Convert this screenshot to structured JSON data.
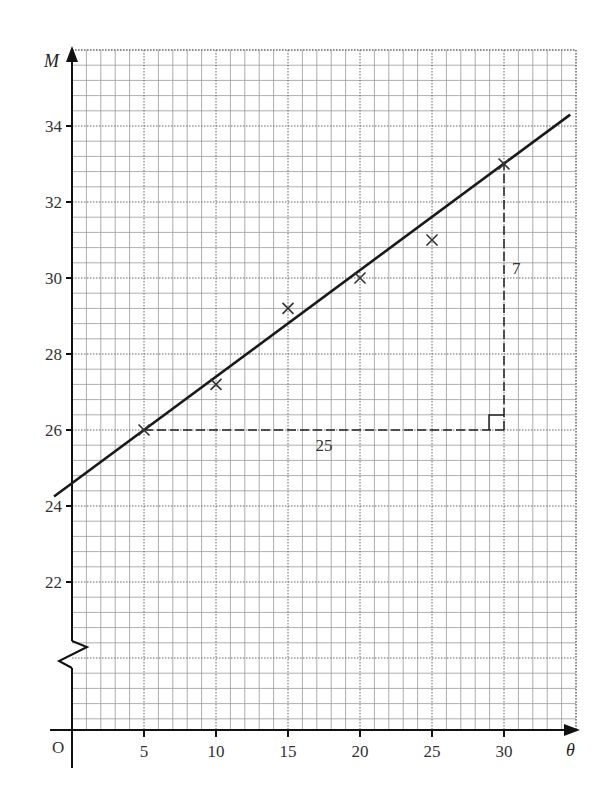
{
  "chart_data": {
    "type": "scatter",
    "title": "",
    "xlabel": "θ",
    "ylabel": "M",
    "origin_label": "O",
    "xlim": [
      0,
      35
    ],
    "ylim": [
      20,
      36
    ],
    "y_axis_broken": true,
    "grid": true,
    "x_ticks": [
      5,
      10,
      15,
      20,
      25,
      30
    ],
    "x_tick_labels": [
      "5",
      "10",
      "15",
      "20",
      "25",
      "30"
    ],
    "y_ticks": [
      22,
      24,
      26,
      28,
      30,
      32,
      34
    ],
    "y_tick_labels": [
      "22",
      "24",
      "26",
      "28",
      "30",
      "32",
      "34"
    ],
    "series": [
      {
        "name": "data points",
        "marker": "x",
        "x": [
          5,
          10,
          15,
          20,
          25,
          30
        ],
        "y": [
          26.0,
          27.2,
          29.2,
          30.0,
          31.0,
          33.0
        ]
      }
    ],
    "line_of_best_fit": {
      "x_start": -1.25,
      "y_start": 24.25,
      "x_end": 34.6,
      "y_end": 34.3,
      "gradient": 0.28,
      "intercept": 24.6
    },
    "gradient_triangle": {
      "from": [
        5,
        26
      ],
      "corner": [
        30,
        26
      ],
      "to": [
        30,
        33
      ],
      "horizontal_label": "25",
      "vertical_label": "7"
    }
  }
}
